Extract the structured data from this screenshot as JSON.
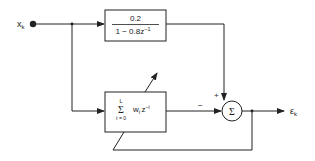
{
  "diagram": {
    "input_label": "x",
    "input_subscript": "k",
    "output_label": "ε",
    "output_subscript": "k",
    "fixed_filter": {
      "numerator": "0.2",
      "denominator_prefix": "1 − 0.8z",
      "denominator_exp": "−1"
    },
    "adaptive_filter": {
      "sum_upper": "L",
      "sum_symbol": "Σ",
      "sum_lower": "ℓ = 0",
      "term": "w",
      "term_subscript": "ℓ",
      "term_z": "z",
      "term_exp": "−ℓ"
    },
    "summer": {
      "symbol": "Σ",
      "plus_sign": "+",
      "minus_sign": "−"
    },
    "colors": {
      "stroke": "#222222",
      "background": "#ffffff"
    }
  }
}
